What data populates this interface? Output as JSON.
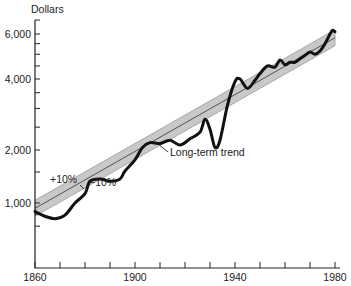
{
  "chart_data": {
    "type": "line",
    "title": "",
    "ylabel": "Dollars",
    "xlabel": "",
    "yscale": "log",
    "xlim": [
      1860,
      1980
    ],
    "ylim": [
      700,
      7000
    ],
    "x_ticks": [
      1860,
      1870,
      1880,
      1890,
      1900,
      1910,
      1920,
      1930,
      1940,
      1950,
      1960,
      1970,
      1980
    ],
    "x_tick_labels": [
      "1860",
      "1900",
      "1940",
      "1980"
    ],
    "y_tick_labels": [
      "1,000",
      "2,000",
      "4,000",
      "6,000"
    ],
    "y_tick_values": [
      1000,
      2000,
      4000,
      6000
    ],
    "series": [
      {
        "name": "Actual",
        "x": [
          1860,
          1864,
          1868,
          1872,
          1876,
          1880,
          1882,
          1886,
          1890,
          1894,
          1896,
          1900,
          1903,
          1906,
          1910,
          1914,
          1918,
          1922,
          1926,
          1928,
          1930,
          1932,
          1934,
          1937,
          1940,
          1942,
          1945,
          1948,
          1950,
          1953,
          1956,
          1958,
          1960,
          1962,
          1964,
          1966,
          1968,
          1970,
          1972,
          1974,
          1976,
          1978,
          1979,
          1980
        ],
        "values": [
          920,
          880,
          860,
          890,
          1000,
          1130,
          1330,
          1370,
          1330,
          1370,
          1520,
          1760,
          2050,
          2150,
          2130,
          2200,
          2100,
          2230,
          2380,
          2700,
          2450,
          2050,
          2200,
          3100,
          3900,
          4000,
          3650,
          3950,
          4200,
          4500,
          4450,
          4750,
          4550,
          4650,
          4650,
          4800,
          4950,
          5100,
          5000,
          5150,
          5500,
          6000,
          6250,
          6150
        ]
      }
    ],
    "trend": {
      "name": "Long-term trend",
      "start": {
        "x": 1860,
        "y": 950
      },
      "end": {
        "x": 1980,
        "y": 5800
      },
      "band_percent": 10
    },
    "annotations": [
      {
        "text": "+10%",
        "x": 1868,
        "y": 1500
      },
      {
        "text": "−10%",
        "x": 1890,
        "y": 1380
      },
      {
        "text": "Long-term trend",
        "x": 1911,
        "y": 1850
      }
    ],
    "grid": false,
    "legend": "none"
  },
  "labels": {
    "y_axis_title": "Dollars",
    "plus": "+10%",
    "minus": "−10%",
    "trend": "Long-term trend"
  }
}
